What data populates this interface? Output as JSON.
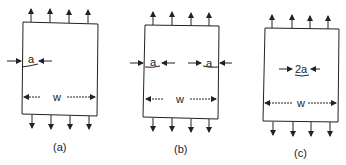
{
  "figure": {
    "panels": [
      {
        "id": "a",
        "caption": "(a)",
        "crack_labels": [
          "a"
        ],
        "width_label": "w",
        "description": "single edge crack"
      },
      {
        "id": "b",
        "caption": "(b)",
        "crack_labels": [
          "a",
          "a"
        ],
        "width_label": "w",
        "description": "double edge cracks"
      },
      {
        "id": "c",
        "caption": "(c)",
        "crack_labels": [
          "2a"
        ],
        "width_label": "w",
        "description": "center crack"
      }
    ],
    "colors": {
      "stroke": "#222222",
      "background": "#ffffff"
    }
  }
}
